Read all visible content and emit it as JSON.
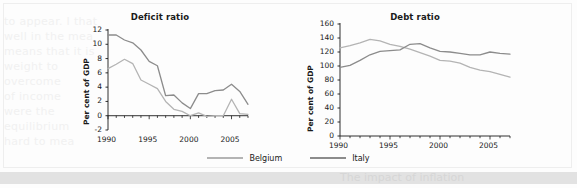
{
  "figure": {
    "bleed_text_left": [
      "to appear. I that",
      "well in the mea",
      "means that it is",
      "weight to",
      "overcome",
      "of income",
      "were the",
      "equilibrium",
      "hard to mea"
    ],
    "bottom_band_text": "The impact of inflation",
    "legend": {
      "items": [
        {
          "label": "Belgium",
          "color": "#b4b4b4",
          "name": "belgium"
        },
        {
          "label": "Italy",
          "color": "#8c8c8c",
          "name": "italy"
        }
      ]
    }
  },
  "chart_data": [
    {
      "type": "line",
      "name": "deficit-ratio",
      "title": "Deficit ratio",
      "xlabel": "",
      "ylabel": "Per cent of GDP",
      "xlim": [
        1990,
        2007
      ],
      "ylim": [
        -2,
        12
      ],
      "yticks": [
        12,
        10,
        8,
        6,
        4,
        2,
        0,
        -2
      ],
      "xticks": [
        1990,
        1995,
        2000,
        2005
      ],
      "grid": false,
      "legend_position": "bottom",
      "x": [
        1990,
        1991,
        1992,
        1993,
        1994,
        1995,
        1996,
        1997,
        1998,
        1999,
        2000,
        2001,
        2002,
        2003,
        2004,
        2005,
        2006,
        2007
      ],
      "series": [
        {
          "name": "Belgium",
          "color": "#b4b4b4",
          "values": [
            6.6,
            7.2,
            7.9,
            7.3,
            5.0,
            4.4,
            3.8,
            2.0,
            0.9,
            0.6,
            0.0,
            0.4,
            -0.1,
            0.0,
            0.0,
            2.3,
            0.3,
            0.2
          ]
        },
        {
          "name": "Italy",
          "color": "#8c8c8c",
          "values": [
            11.3,
            11.3,
            10.6,
            10.2,
            9.2,
            7.6,
            7.0,
            2.8,
            2.9,
            1.8,
            1.0,
            3.1,
            3.1,
            3.5,
            3.6,
            4.4,
            3.4,
            1.6
          ]
        }
      ]
    },
    {
      "type": "line",
      "name": "debt-ratio",
      "title": "Debt ratio",
      "xlabel": "",
      "ylabel": "Per cent of GDP",
      "xlim": [
        1990,
        2007
      ],
      "ylim": [
        0,
        160
      ],
      "yticks": [
        160,
        140,
        120,
        100,
        80,
        60,
        40,
        20,
        0
      ],
      "xticks": [
        1990,
        1995,
        2000,
        2005
      ],
      "grid": false,
      "legend_position": "bottom",
      "x": [
        1990,
        1991,
        1992,
        1993,
        1994,
        1995,
        1996,
        1997,
        1998,
        1999,
        2000,
        2001,
        2002,
        2003,
        2004,
        2005,
        2006,
        2007
      ],
      "series": [
        {
          "name": "Belgium",
          "color": "#b4b4b4",
          "values": [
            126,
            129,
            133,
            138,
            136,
            131,
            128,
            124,
            119,
            114,
            108,
            107,
            104,
            98,
            94,
            92,
            88,
            84
          ]
        },
        {
          "name": "Italy",
          "color": "#8c8c8c",
          "values": [
            98,
            101,
            108,
            116,
            121,
            122,
            123,
            131,
            132,
            126,
            121,
            120,
            118,
            116,
            116,
            120,
            118,
            117
          ]
        }
      ]
    }
  ]
}
